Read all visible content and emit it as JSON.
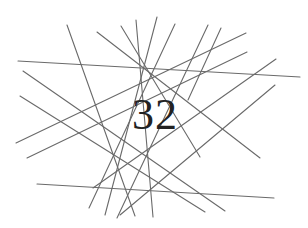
{
  "captcha": {
    "text": "32",
    "text_color": "#222222",
    "line_color": "#6a6a6a",
    "background": "#ffffff",
    "lines": [
      {
        "x1": 18,
        "y1": 61,
        "x2": 300,
        "y2": 77
      },
      {
        "x1": 37,
        "y1": 184,
        "x2": 274,
        "y2": 198
      },
      {
        "x1": 67,
        "y1": 25,
        "x2": 135,
        "y2": 216
      },
      {
        "x1": 97,
        "y1": 32,
        "x2": 260,
        "y2": 158
      },
      {
        "x1": 121,
        "y1": 26,
        "x2": 200,
        "y2": 157
      },
      {
        "x1": 136,
        "y1": 20,
        "x2": 153,
        "y2": 217
      },
      {
        "x1": 157,
        "y1": 17,
        "x2": 105,
        "y2": 215
      },
      {
        "x1": 175,
        "y1": 24,
        "x2": 89,
        "y2": 208
      },
      {
        "x1": 208,
        "y1": 25,
        "x2": 117,
        "y2": 218
      },
      {
        "x1": 276,
        "y1": 59,
        "x2": 93,
        "y2": 188
      },
      {
        "x1": 275,
        "y1": 85,
        "x2": 120,
        "y2": 215
      },
      {
        "x1": 23,
        "y1": 71,
        "x2": 225,
        "y2": 211
      },
      {
        "x1": 20,
        "y1": 96,
        "x2": 205,
        "y2": 212
      },
      {
        "x1": 246,
        "y1": 33,
        "x2": 16,
        "y2": 143
      },
      {
        "x1": 247,
        "y1": 52,
        "x2": 27,
        "y2": 158
      },
      {
        "x1": 221,
        "y1": 28,
        "x2": 188,
        "y2": 100
      }
    ]
  }
}
